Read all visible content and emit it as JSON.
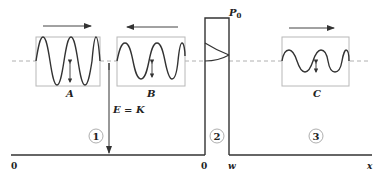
{
  "diagram": {
    "barrier_label": "P0",
    "barrier_label_main": "P",
    "barrier_label_sub": "0",
    "energy_label": "E = K",
    "regions": [
      {
        "id": "1",
        "label": "1"
      },
      {
        "id": "2",
        "label": "2"
      },
      {
        "id": "3",
        "label": "3"
      }
    ],
    "waves": [
      {
        "id": "A",
        "label": "A",
        "direction": "right",
        "amplitude": "large"
      },
      {
        "id": "B",
        "label": "B",
        "direction": "left",
        "amplitude": "medium"
      },
      {
        "id": "C",
        "label": "C",
        "direction": "right",
        "amplitude": "small"
      }
    ],
    "axis": {
      "origin_label": "0",
      "barrier_start_label": "0",
      "barrier_end_label": "w",
      "x_label": "x"
    }
  },
  "colors": {
    "line": "#333333",
    "box": "#b8b8b8",
    "dashed": "#b0b0b0",
    "text": "#222222"
  }
}
